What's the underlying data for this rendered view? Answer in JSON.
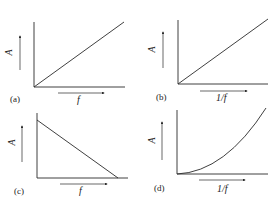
{
  "figure": {
    "panels": [
      {
        "id": "a",
        "label": "(a)",
        "x_label": "f",
        "y_label": "A",
        "relation": "linear increasing from origin"
      },
      {
        "id": "b",
        "label": "(b)",
        "x_label": "1/f",
        "y_label": "A",
        "relation": "linear increasing from origin"
      },
      {
        "id": "c",
        "label": "(c)",
        "x_label": "f",
        "y_label": "A",
        "relation": "linear decreasing"
      },
      {
        "id": "d",
        "label": "(d)",
        "x_label": "1/f",
        "y_label": "A",
        "relation": "parabolic increasing from origin"
      }
    ]
  },
  "colors": {
    "line": "#2a2a2a",
    "background": "#ffffff"
  }
}
